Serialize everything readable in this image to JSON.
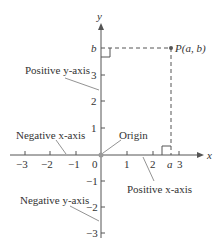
{
  "diagram": {
    "axes": {
      "x_label": "x",
      "y_label": "y"
    },
    "x_ticks": [
      {
        "label": "−3",
        "x": 25
      },
      {
        "label": "−2",
        "x": 50
      },
      {
        "label": "−1",
        "x": 76
      },
      {
        "label": "1",
        "x": 127
      },
      {
        "label": "2",
        "x": 153
      },
      {
        "label": "3",
        "x": 179
      }
    ],
    "y_ticks": [
      {
        "label": "3",
        "y": 75
      },
      {
        "label": "2",
        "y": 101
      },
      {
        "label": "1",
        "y": 128
      },
      {
        "label": "−1",
        "y": 181
      },
      {
        "label": "−2",
        "y": 207
      },
      {
        "label": "−3",
        "y": 233
      }
    ],
    "origin_label": "0",
    "point_label": "P(a, b)",
    "a_label": "a",
    "b_label": "b",
    "annotations": {
      "positive_y": "Positive y-axis",
      "negative_x": "Negative x-axis",
      "origin": "Origin",
      "positive_x": "Positive x-axis",
      "negative_y": "Negative y-axis"
    }
  }
}
